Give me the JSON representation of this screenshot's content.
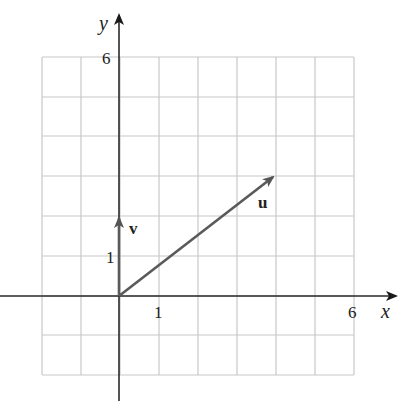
{
  "diagram": {
    "type": "vector-plot",
    "axes": {
      "x_label": "x",
      "y_label": "y",
      "x_tick_labels": [
        "1",
        "6"
      ],
      "y_tick_labels": [
        "1",
        "6"
      ],
      "x_range": [
        -2,
        6
      ],
      "y_range": [
        -2,
        6
      ],
      "grid": true
    },
    "vectors": [
      {
        "name": "u",
        "label": "u",
        "from": [
          0,
          0
        ],
        "to": [
          4,
          3
        ]
      },
      {
        "name": "v",
        "label": "v",
        "from": [
          0,
          0
        ],
        "to": [
          0,
          2
        ]
      }
    ],
    "colors": {
      "grid": "#c8c8c8",
      "axis": "#2a2a2a",
      "vector": "#5a5a5a"
    }
  }
}
